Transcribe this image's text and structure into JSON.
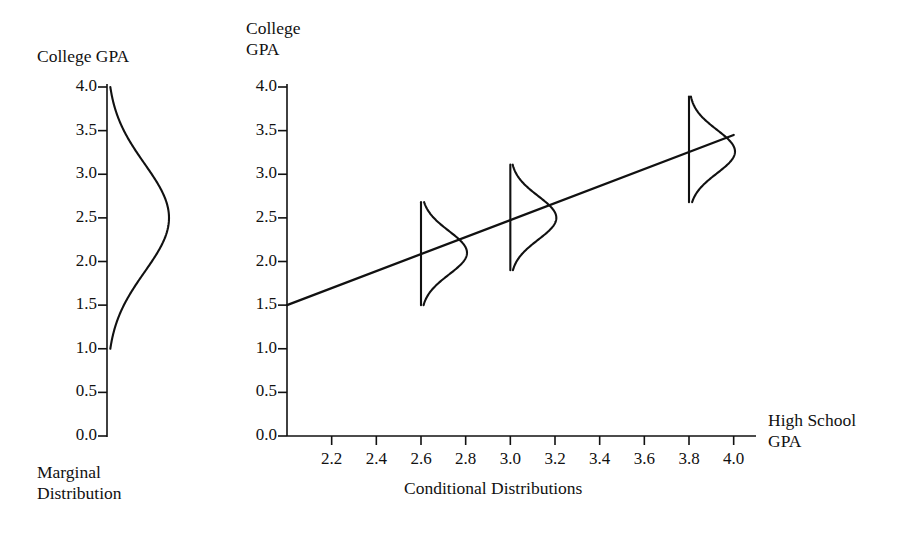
{
  "figure": {
    "background": "#ffffff",
    "ink": "#111111",
    "left_panel": {
      "axis_title": "College GPA",
      "caption": "Marginal\nDistribution",
      "y_ticks": [
        "4.0",
        "3.5",
        "3.0",
        "2.5",
        "2.0",
        "1.5",
        "1.0",
        "0.5",
        "0.0"
      ]
    },
    "right_panel": {
      "axis_title": "College\nGPA",
      "x_axis_title": "High School\nGPA",
      "caption": "Conditional Distributions",
      "y_ticks": [
        "4.0",
        "3.5",
        "3.0",
        "2.5",
        "2.0",
        "1.5",
        "1.0",
        "0.5",
        "0.0"
      ],
      "x_ticks": [
        "2.2",
        "2.4",
        "2.6",
        "2.8",
        "3.0",
        "3.2",
        "3.4",
        "3.6",
        "3.8",
        "4.0"
      ]
    }
  },
  "chart_data": {
    "type": "line",
    "xlabel": "High School GPA",
    "ylabel": "College GPA",
    "grid": false,
    "legend": null,
    "panels": [
      {
        "name": "marginal-distribution",
        "type": "density",
        "orientation": "vertical",
        "variable": "College GPA",
        "ylim": [
          0.0,
          4.0
        ],
        "y_ticks": [
          4.0,
          3.5,
          3.0,
          2.5,
          2.0,
          1.5,
          1.0,
          0.5,
          0.0
        ],
        "density": {
          "mean": 2.5,
          "sd": 0.62,
          "support": [
            1.0,
            4.0
          ],
          "peak_at": 2.5
        },
        "caption": "Marginal Distribution"
      },
      {
        "name": "conditional-distributions",
        "type": "scatter-regression",
        "xlim": [
          2.0,
          4.1
        ],
        "ylim": [
          0.0,
          4.0
        ],
        "x_ticks": [
          2.2,
          2.4,
          2.6,
          2.8,
          3.0,
          3.2,
          3.4,
          3.6,
          3.8,
          4.0
        ],
        "y_ticks": [
          4.0,
          3.5,
          3.0,
          2.5,
          2.0,
          1.5,
          1.0,
          0.5,
          0.0
        ],
        "regression_line": {
          "x_start": 2.0,
          "y_start": 1.5,
          "x_end": 4.0,
          "y_end": 3.45,
          "slope": 0.975,
          "intercept": -0.45
        },
        "conditional_densities": [
          {
            "x": 2.6,
            "mean": 2.1,
            "sd": 0.25,
            "support": [
              1.5,
              2.68
            ]
          },
          {
            "x": 3.0,
            "mean": 2.5,
            "sd": 0.25,
            "support": [
              1.9,
              3.11
            ]
          },
          {
            "x": 3.8,
            "mean": 3.26,
            "sd": 0.25,
            "support": [
              2.68,
              3.89
            ]
          }
        ],
        "caption": "Conditional Distributions"
      }
    ]
  }
}
